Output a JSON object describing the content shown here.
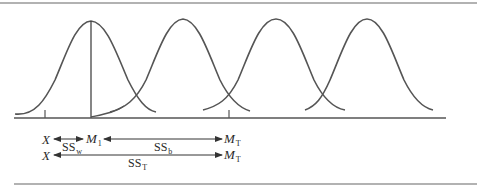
{
  "figure": {
    "colors": {
      "line": "#555555",
      "text": "#2a2a2a",
      "rule": "#666666"
    },
    "curves": [
      {
        "id": "group-1",
        "peak_x": 91
      },
      {
        "id": "group-2",
        "peak_x": 183
      },
      {
        "id": "group-3",
        "peak_x": 276
      },
      {
        "id": "group-4",
        "peak_x": 367
      }
    ],
    "ticks": [
      {
        "id": "score-x",
        "x": 45
      },
      {
        "id": "grand-mean",
        "x": 229
      }
    ],
    "labels": {
      "row1_x": "X",
      "row1_m1_main": "M",
      "row1_m1_sub": "1",
      "row1_mt_main": "M",
      "row1_mt_sub": "T",
      "row2_x": "X",
      "row2_mt_main": "M",
      "row2_mt_sub": "T",
      "ss_within_main": "SS",
      "ss_within_sub": "w",
      "ss_between_main": "SS",
      "ss_between_sub": "b",
      "ss_total_main": "SS",
      "ss_total_sub": "T"
    }
  }
}
